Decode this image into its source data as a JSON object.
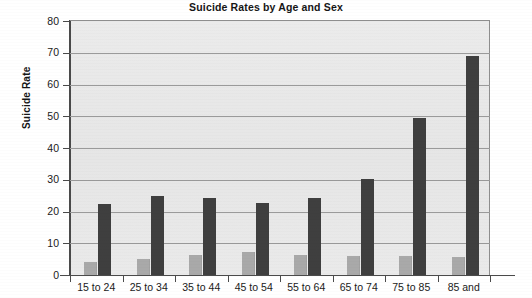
{
  "chart_data": {
    "type": "bar",
    "title": "Suicide Rates by Age and Sex",
    "xlabel": "",
    "ylabel": "Suicide Rate",
    "ylim": [
      0,
      80
    ],
    "ytick_step": 10,
    "yticks": [
      "0",
      "10",
      "20",
      "30",
      "40",
      "50",
      "60",
      "70",
      "80"
    ],
    "grid": true,
    "legend": "none",
    "grouped": true,
    "categories": [
      "15 to 24",
      "25 to 34",
      "35 to 44",
      "45 to 54",
      "55 to 64",
      "65 to 74",
      "75 to 85",
      "85 and"
    ],
    "series": [
      {
        "name": "Female",
        "color": "#a9a9a9",
        "values": [
          4.2,
          5.2,
          6.4,
          7.1,
          6.4,
          6.0,
          6.0,
          5.6
        ]
      },
      {
        "name": "Male",
        "color": "#3f3f3f",
        "values": [
          22.4,
          25.0,
          24.4,
          22.7,
          24.1,
          30.2,
          49.5,
          69.0
        ]
      }
    ]
  },
  "colors": {
    "plot_background": "#e8e8e8",
    "axis": "#4a4a4a",
    "gridline": "#9a9a9a",
    "page_background": "#ffffff",
    "text": "#1a1a1a"
  }
}
